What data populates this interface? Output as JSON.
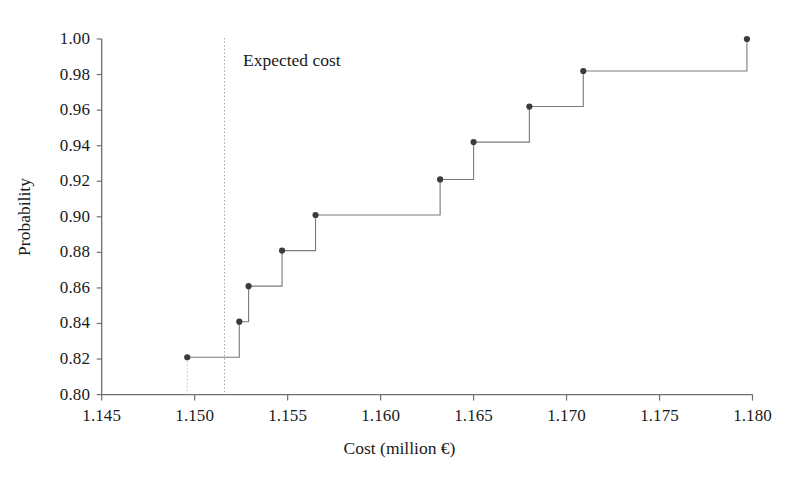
{
  "chart_data": {
    "type": "line",
    "subtype": "step-cdf",
    "title": "",
    "xlabel": "Cost (million €)",
    "ylabel": "Probability",
    "xlim": [
      1.145,
      1.18
    ],
    "ylim": [
      0.8,
      1.0
    ],
    "xticks": [
      "1.145",
      "1.150",
      "1.155",
      "1.160",
      "1.165",
      "1.170",
      "1.175",
      "1.180"
    ],
    "xtick_values": [
      1.145,
      1.15,
      1.155,
      1.16,
      1.165,
      1.17,
      1.175,
      1.18
    ],
    "yticks": [
      "0.80",
      "0.82",
      "0.84",
      "0.86",
      "0.88",
      "0.90",
      "0.92",
      "0.94",
      "0.96",
      "0.98",
      "1.00"
    ],
    "ytick_values": [
      0.8,
      0.82,
      0.84,
      0.86,
      0.88,
      0.9,
      0.92,
      0.94,
      0.96,
      0.98,
      1.0
    ],
    "grid": false,
    "legend": null,
    "x": [
      1.1496,
      1.1524,
      1.1529,
      1.1547,
      1.1565,
      1.1632,
      1.165,
      1.168,
      1.1709,
      1.1797
    ],
    "y": [
      0.821,
      0.841,
      0.861,
      0.881,
      0.901,
      0.921,
      0.942,
      0.962,
      0.982,
      1.0
    ],
    "series": [
      {
        "name": "Cumulative probability",
        "points": [
          {
            "x": 1.1496,
            "y": 0.821
          },
          {
            "x": 1.1524,
            "y": 0.841
          },
          {
            "x": 1.1529,
            "y": 0.861
          },
          {
            "x": 1.1547,
            "y": 0.881
          },
          {
            "x": 1.1565,
            "y": 0.901
          },
          {
            "x": 1.1632,
            "y": 0.921
          },
          {
            "x": 1.165,
            "y": 0.942
          },
          {
            "x": 1.168,
            "y": 0.962
          },
          {
            "x": 1.1709,
            "y": 0.982
          },
          {
            "x": 1.1797,
            "y": 1.0
          }
        ],
        "marker": "circle",
        "marker_color": "#3b3b3b",
        "line_color": "#7a7a7a",
        "step": "post"
      }
    ],
    "annotations": [
      {
        "name": "expected-cost",
        "label": "Expected cost",
        "type": "vertical-line",
        "x": 1.1516,
        "style": "dotted",
        "color": "#9a9a9a"
      }
    ]
  },
  "axes": {
    "y_label": "Probability",
    "x_label": "Cost (million €)",
    "y_tick_labels": [
      "1.00",
      "0.98",
      "0.96",
      "0.94",
      "0.92",
      "0.90",
      "0.88",
      "0.86",
      "0.84",
      "0.82",
      "0.80"
    ],
    "x_tick_labels": [
      "1.145",
      "1.150",
      "1.155",
      "1.160",
      "1.165",
      "1.170",
      "1.175",
      "1.180"
    ]
  },
  "annotation": {
    "expected_cost_label": "Expected cost"
  },
  "colors": {
    "axis": "#6f6f6f",
    "line": "#7d7d7d",
    "marker": "#3a3a3a",
    "annotation_line": "#a0a0a0",
    "text": "#1a1a1a",
    "background": "#ffffff"
  }
}
